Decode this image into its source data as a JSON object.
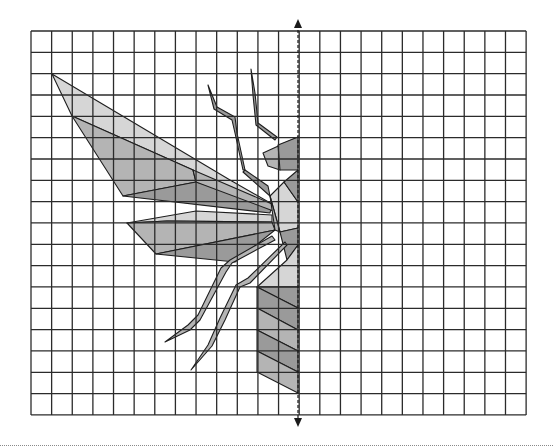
{
  "grid": {
    "x0": 31,
    "y0": 31,
    "cols": 24,
    "rows": 18,
    "cell_w": 20.63,
    "cell_h": 21.33,
    "line_color": "#2b2b2b"
  },
  "axis": {
    "label": "line of symmetry",
    "x": 298,
    "y_top": 19,
    "y_bottom": 427,
    "style": "dashed with arrowheads"
  },
  "colors": {
    "light": "#d6d6d6",
    "mid": "#b4b4b4",
    "dark": "#9a9a9a",
    "edge": "#1e1e1e"
  },
  "figure": {
    "name": "half insect (wasp/fly)",
    "parts": [
      {
        "name": "upper-wing-light",
        "fill": "light",
        "points": "52,74 72,116 193,170 196,182 272,204 230,180"
      },
      {
        "name": "upper-wing-mid",
        "fill": "mid",
        "points": "72,116 123,196 196,182 193,170"
      },
      {
        "name": "upper-wing-dark",
        "fill": "dark",
        "points": "123,196 196,182 272,204 270,213"
      },
      {
        "name": "upper-wing-strip",
        "fill": "mid",
        "points": "193,170 272,204 276,212 196,182"
      },
      {
        "name": "lower-wing-top",
        "fill": "light",
        "points": "127,223 196,211 272,215 272,222 167,221"
      },
      {
        "name": "lower-wing-mid",
        "fill": "mid",
        "points": "127,223 167,221 272,222 275,230 156,254"
      },
      {
        "name": "lower-wing-bottom",
        "fill": "dark",
        "points": "156,254 275,230 235,262"
      },
      {
        "name": "antenna-left",
        "fill": "dark",
        "points": "208,85 217,107 235,117 237,133 245,170 243,170 235,133 232,120 214,109"
      },
      {
        "name": "antenna-right",
        "fill": "dark",
        "points": "251,69 255,93 258,123 277,137 275,140 256,125 253,95"
      },
      {
        "name": "head-left",
        "fill": "mid",
        "points": "263,153 298,137 280,170 268,166"
      },
      {
        "name": "head-right",
        "fill": "dark",
        "points": "278,145 298,137 298,170 280,170"
      },
      {
        "name": "neck-strut",
        "fill": "dark",
        "points": "245,170 268,186 270,196 243,172"
      },
      {
        "name": "thorax-light",
        "fill": "light",
        "points": "270,196 284,182 298,202 298,228 280,232"
      },
      {
        "name": "thorax-mid",
        "fill": "mid",
        "points": "270,196 280,232 275,230"
      },
      {
        "name": "thorax-dark",
        "fill": "dark",
        "points": "284,182 298,170 298,202"
      },
      {
        "name": "thorax-lower",
        "fill": "dark",
        "points": "280,232 298,228 298,245 287,260"
      },
      {
        "name": "leg-front",
        "fill": "mid",
        "points": "275,240 232,263 226,272 200,320 190,330 165,342 188,325 198,315 221,268 230,260 272,236"
      },
      {
        "name": "leg-hind",
        "fill": "mid",
        "points": "287,245 250,283 240,287 225,320 212,346 191,370 208,345 220,318 236,285 248,278 285,242"
      },
      {
        "name": "waist-light",
        "fill": "light",
        "points": "287,260 298,245 298,287 257,287"
      },
      {
        "name": "abdomen-1",
        "fill": "dark",
        "points": "257,287 298,287 298,308 257,287"
      },
      {
        "name": "abdomen-2",
        "fill": "dark",
        "points": "257,287 298,308 298,330 257,308"
      },
      {
        "name": "abdomen-3",
        "fill": "mid",
        "points": "257,308 298,330 298,351 257,330"
      },
      {
        "name": "abdomen-4",
        "fill": "dark",
        "points": "257,330 298,351 298,372 257,351"
      },
      {
        "name": "abdomen-5",
        "fill": "mid",
        "points": "257,351 298,372 298,393 257,372"
      }
    ]
  }
}
